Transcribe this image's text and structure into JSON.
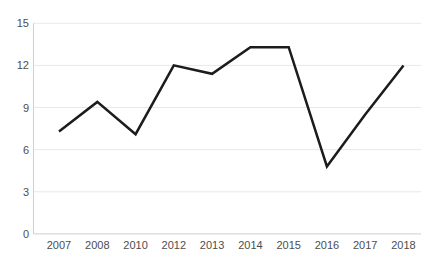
{
  "chart_data": {
    "type": "line",
    "title": "",
    "xlabel": "",
    "ylabel": "",
    "categories": [
      "2007",
      "2008",
      "2010",
      "2012",
      "2013",
      "2014",
      "2015",
      "2016",
      "2017",
      "2018"
    ],
    "series": [
      {
        "name": "series-1",
        "values": [
          7.3,
          9.4,
          7.1,
          12,
          11.4,
          13.3,
          13.3,
          4.8,
          8.5,
          12
        ]
      }
    ],
    "ylim": [
      0,
      15
    ],
    "yticks": [
      0,
      3,
      6,
      9,
      12,
      15
    ],
    "grid": "horizontal",
    "legend": "none",
    "colors": {
      "line": "#1c1c1c",
      "gridline": "#e8e8e8",
      "axis": "#cfcfcf",
      "tick_label": "#4d4d4d",
      "background": "#ffffff"
    }
  }
}
